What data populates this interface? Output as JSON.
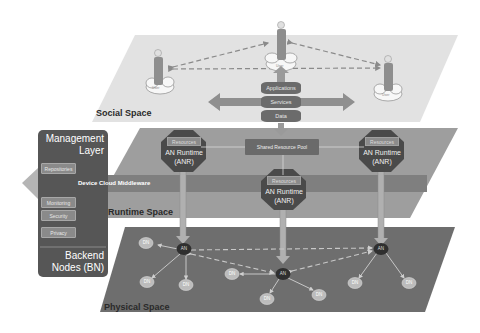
{
  "layers": {
    "social": {
      "label": "Social Space",
      "color": "#dedede"
    },
    "runtime": {
      "label": "Runtime Space",
      "color": "#9b9b9b"
    },
    "physical": {
      "label": "Physical Space",
      "color": "#707070"
    }
  },
  "social_space": {
    "users": [
      {
        "label": "User"
      },
      {
        "label": "User"
      },
      {
        "label": "User"
      }
    ],
    "stack": [
      "Applications",
      "Services",
      "Data"
    ]
  },
  "management": {
    "title_line1": "Management",
    "title_line2": "Layer",
    "repositories": "Repositories",
    "monitoring": "Monitoring",
    "security": "Security",
    "privacy": "Privacy",
    "backend_line1": "Backend",
    "backend_line2": "Nodes (BN)"
  },
  "runtime_space": {
    "middleware_label": "Device Cloud Middleware",
    "shared_pool": "Shared Resource Pool",
    "anr": [
      {
        "resources": "Resources",
        "line1": "AN Runtime",
        "line2": "(ANR)"
      },
      {
        "resources": "Resources",
        "line1": "AN Runtime",
        "line2": "(ANR)"
      },
      {
        "resources": "Resources",
        "line1": "AN Runtime",
        "line2": "(ANR)"
      }
    ]
  },
  "physical_space": {
    "an_label": "AN",
    "dn_label": "DN"
  },
  "colors": {
    "octagon": "#4a4a4a",
    "arrow": "#8c8c8c",
    "an_node": "#2f2f2f",
    "dn_node": "#b8b8b8",
    "mgmt_panel": "#555555"
  }
}
